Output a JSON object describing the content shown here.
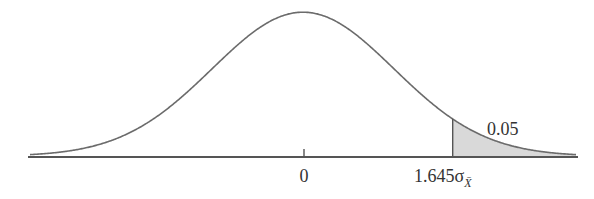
{
  "chart_data": {
    "type": "area",
    "title": "",
    "xlabel": "",
    "ylabel": "",
    "distribution": "normal",
    "mean_label": "0",
    "critical_value_label": "1.645σ",
    "critical_value_subscript": "X̄",
    "critical_z": 1.645,
    "tail_area_label": "0.05",
    "tail_area": 0.05,
    "shaded_region": "upper tail (x > 1.645σ)",
    "x_range_sigma": [
      -3,
      3
    ],
    "grid": false,
    "legend": false
  },
  "colors": {
    "curve": "#6b6b6b",
    "axis": "#555555",
    "shade": "#d9d9d9",
    "text": "#333333"
  }
}
